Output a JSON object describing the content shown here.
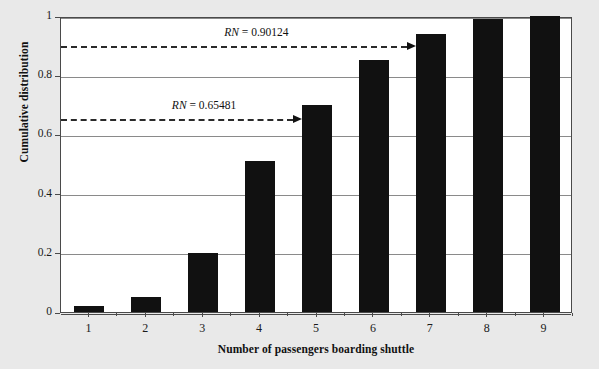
{
  "chart_data": {
    "type": "bar",
    "title": "",
    "xlabel": "Number of passengers boarding shuttle",
    "ylabel": "Cumulative distribution",
    "categories": [
      "1",
      "2",
      "3",
      "4",
      "5",
      "6",
      "7",
      "8",
      "9"
    ],
    "values": [
      0.02,
      0.05,
      0.2,
      0.51,
      0.7,
      0.85,
      0.94,
      0.99,
      1.0
    ],
    "series": [
      {
        "name": "Cumulative distribution",
        "values": [
          0.02,
          0.05,
          0.2,
          0.51,
          0.7,
          0.85,
          0.94,
          0.99,
          1.0
        ],
        "color": "#111111"
      }
    ],
    "ylim": [
      0,
      1
    ],
    "yticks": [
      0,
      0.2,
      0.4,
      0.6,
      0.8,
      1
    ],
    "ytick_labels": [
      "0",
      "0.2",
      "0.4",
      "0.6",
      "0.8",
      "1"
    ],
    "grid": true,
    "legend": "none",
    "bar_color": "#111111",
    "plot_background": "#ffffff",
    "figure_background": "#e9e9e9",
    "annotations": [
      {
        "id": "rn-high",
        "prefix": "RN",
        "text": " = 0.90124",
        "full_text": "RN = 0.90124",
        "value": 0.90124,
        "target_category": "7",
        "style": "dashed-arrow"
      },
      {
        "id": "rn-low",
        "prefix": "RN",
        "text": " = 0.65481",
        "full_text": "RN = 0.65481",
        "value": 0.65481,
        "target_category": "5",
        "style": "dashed-arrow"
      }
    ]
  }
}
